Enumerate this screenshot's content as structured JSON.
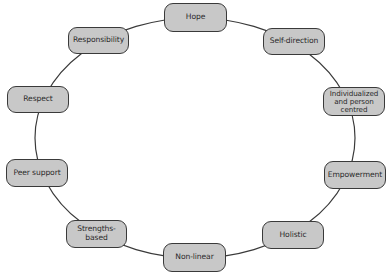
{
  "diagram": {
    "type": "cycle",
    "colors": {
      "node_fill": "#c8c8c8",
      "node_border": "#3a3a3a",
      "line": "#3a3a3a",
      "text": "#2b2b2b",
      "background": "#ffffff"
    },
    "ring": {
      "cx": 195,
      "cy": 138,
      "rx": 160,
      "ry": 120
    },
    "nodes": [
      {
        "id": "hope",
        "label": "Hope"
      },
      {
        "id": "self-direction",
        "label": "Self-direction"
      },
      {
        "id": "individualized",
        "label": "Individualized\nand person\ncentred"
      },
      {
        "id": "empowerment",
        "label": "Empowerment"
      },
      {
        "id": "holistic",
        "label": "Holistic"
      },
      {
        "id": "non-linear",
        "label": "Non-linear"
      },
      {
        "id": "strengths-based",
        "label": "Strengths-\nbased"
      },
      {
        "id": "peer-support",
        "label": "Peer support"
      },
      {
        "id": "respect",
        "label": "Respect"
      },
      {
        "id": "responsibility",
        "label": "Responsibility"
      }
    ]
  }
}
